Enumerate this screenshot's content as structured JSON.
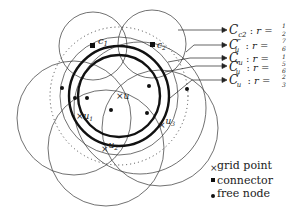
{
  "diagram": {
    "center_label": "u",
    "grid_points": [
      {
        "label": "u",
        "x": 119,
        "y": 96
      },
      {
        "label": "u1",
        "x": 80,
        "y": 116
      },
      {
        "label": "u2",
        "x": 106,
        "y": 148
      },
      {
        "label": "u3",
        "x": 163,
        "y": 125
      }
    ],
    "connectors": [
      {
        "label": "c1",
        "x": 93,
        "y": 46
      },
      {
        "label": "c2",
        "x": 152,
        "y": 44
      }
    ],
    "free_nodes": [
      {
        "x": 62,
        "y": 88
      },
      {
        "x": 75,
        "y": 98
      },
      {
        "x": 87,
        "y": 98
      },
      {
        "x": 111,
        "y": 110
      },
      {
        "x": 149,
        "y": 86
      },
      {
        "x": 147,
        "y": 113
      },
      {
        "x": 187,
        "y": 89
      }
    ],
    "circle_labels": [
      {
        "name": "C_c2",
        "main": "C",
        "sub": "c2",
        "sup": "",
        "radius_num": "1",
        "radius_den": "2"
      },
      {
        "name": "C_u'''",
        "main": "C",
        "sub": "u",
        "sup": "‴",
        "radius_num": "7",
        "radius_den": "6"
      },
      {
        "name": "C_u",
        "main": "C",
        "sub": "u",
        "sup": "",
        "radius_num": "1",
        "radius_den": ""
      },
      {
        "name": "C_u''",
        "main": "C",
        "sub": "u",
        "sup": "″",
        "radius_num": "5",
        "radius_den": "6"
      },
      {
        "name": "C_u'",
        "main": "C",
        "sub": "u",
        "sup": "′",
        "radius_num": "2",
        "radius_den": "3"
      }
    ],
    "radius_prefix": ": r =",
    "legend": [
      {
        "symbol": "cross",
        "label": "grid point"
      },
      {
        "symbol": "square",
        "label": "connector"
      },
      {
        "symbol": "dot",
        "label": "free node"
      }
    ]
  }
}
